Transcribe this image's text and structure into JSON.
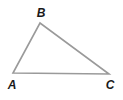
{
  "diagram": {
    "type": "triangle",
    "stroke_color": "#9a9a9a",
    "vertices": [
      {
        "name": "A",
        "label": "A",
        "x": 13,
        "y": 73,
        "label_x": 12,
        "label_y": 89
      },
      {
        "name": "B",
        "label": "B",
        "x": 40,
        "y": 23,
        "label_x": 41,
        "label_y": 17
      },
      {
        "name": "C",
        "label": "C",
        "x": 109,
        "y": 74,
        "label_x": 110,
        "label_y": 89
      }
    ]
  }
}
